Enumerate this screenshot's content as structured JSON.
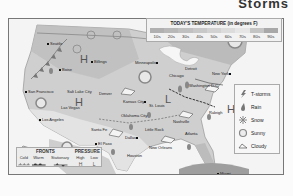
{
  "header": {
    "title": "Storms"
  },
  "map": {
    "background_color": "#d9d9d9",
    "cities": [
      {
        "name": "Seattle",
        "x": 38,
        "y": 22
      },
      {
        "name": "Boise",
        "x": 55,
        "y": 50
      },
      {
        "name": "Billings",
        "x": 86,
        "y": 42
      },
      {
        "name": "Minneapolis",
        "x": 139,
        "y": 43
      },
      {
        "name": "San Francisco",
        "x": 20,
        "y": 70
      },
      {
        "name": "Salt Lake City",
        "x": 60,
        "y": 69
      },
      {
        "name": "Denver",
        "x": 96,
        "y": 71
      },
      {
        "name": "Las Vegas",
        "x": 47,
        "y": 85
      },
      {
        "name": "Los Angeles",
        "x": 30,
        "y": 96
      },
      {
        "name": "Santa Fe",
        "x": 83,
        "y": 106
      },
      {
        "name": "El Paso",
        "x": 80,
        "y": 120
      },
      {
        "name": "Kansas City",
        "x": 120,
        "y": 79
      },
      {
        "name": "Chicago",
        "x": 165,
        "y": 51
      },
      {
        "name": "Detroit",
        "x": 180,
        "y": 48
      },
      {
        "name": "New York",
        "x": 210,
        "y": 53
      },
      {
        "name": "St. Louis",
        "x": 140,
        "y": 88
      },
      {
        "name": "Washington D.C.",
        "x": 190,
        "y": 70
      },
      {
        "name": "Oklahoma City",
        "x": 124,
        "y": 98
      },
      {
        "name": "Nashville",
        "x": 165,
        "y": 98
      },
      {
        "name": "Raleigh",
        "x": 198,
        "y": 88
      },
      {
        "name": "Little Rock",
        "x": 148,
        "y": 106
      },
      {
        "name": "Dallas",
        "x": 118,
        "y": 115
      },
      {
        "name": "Atlanta",
        "x": 178,
        "y": 110
      },
      {
        "name": "Houston",
        "x": 124,
        "y": 134
      },
      {
        "name": "New Orleans",
        "x": 150,
        "y": 130
      },
      {
        "name": "Miami",
        "x": 209,
        "y": 153
      }
    ],
    "pressure_marks": [
      {
        "label": "H",
        "x": 71,
        "y": 38
      },
      {
        "label": "H",
        "x": 66,
        "y": 81
      },
      {
        "label": "L",
        "x": 156,
        "y": 78
      },
      {
        "label": "H",
        "x": 218,
        "y": 88
      }
    ]
  },
  "temperature_legend": {
    "title": "TODAY'S TEMPERATURE (in degrees F)",
    "bands": [
      {
        "label": "10s",
        "color": "#b0b0b0"
      },
      {
        "label": "20s",
        "color": "#b8b8b8"
      },
      {
        "label": "30s",
        "color": "#c0c0c0"
      },
      {
        "label": "40s",
        "color": "#c8c8c8"
      },
      {
        "label": "50s",
        "color": "#d2d2d2"
      },
      {
        "label": "60s",
        "color": "#dcdcdc"
      },
      {
        "label": "70s",
        "color": "#e6e6e6"
      },
      {
        "label": "80s",
        "color": "#c4c4c4"
      },
      {
        "label": "90s",
        "color": "#a8a8a8"
      }
    ]
  },
  "weather_legend": {
    "items": [
      {
        "icon": "tstorms-icon",
        "label": "T-storms"
      },
      {
        "icon": "rain-icon",
        "label": "Rain"
      },
      {
        "icon": "snow-icon",
        "label": "Snow"
      },
      {
        "icon": "sunny-icon",
        "label": "Sunny"
      },
      {
        "icon": "cloudy-icon",
        "label": "Cloudy"
      }
    ]
  },
  "fronts_pressure_legend": {
    "fronts_title": "FRONTS",
    "pressure_title": "PRESSURE",
    "fronts": [
      "Cold",
      "Warm",
      "Stationary"
    ],
    "pressure": [
      {
        "label": "High",
        "symbol": "H"
      },
      {
        "label": "Low",
        "symbol": "L"
      }
    ]
  }
}
